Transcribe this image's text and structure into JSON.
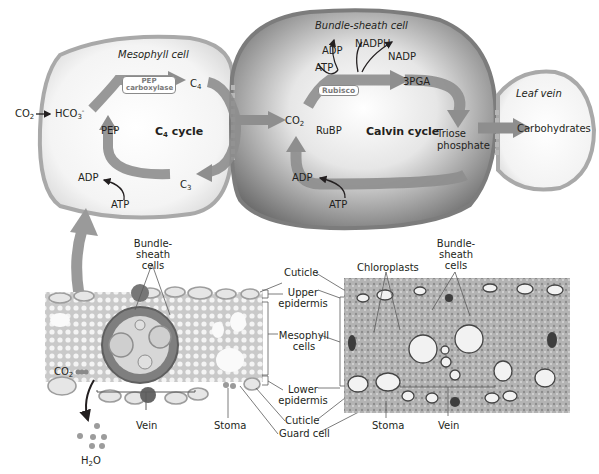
{
  "cells": {
    "mesophyll": {
      "title": "Mesophyll cell",
      "cycle": "C4 cycle",
      "enzyme": {
        "line1": "PEP",
        "line2": "carboxylase"
      },
      "labels": {
        "co2": "CO2",
        "hco3": "HCO3-",
        "pep": "PEP",
        "c4": "C4",
        "c3": "C3",
        "adp": "ADP",
        "atp": "ATP"
      }
    },
    "bundle_sheath": {
      "title": "Bundle-sheath cell",
      "cycle": "Calvin cycle",
      "enzyme": "Rubisco",
      "labels": {
        "co2": "CO2",
        "adp_top": "ADP",
        "atp_top": "ATP",
        "nadph": "NADPH",
        "nadp": "NADP",
        "pga": "3PGA",
        "rubp": "RuBP",
        "triose1": "Triose",
        "triose2": "phosphate",
        "adp_bottom": "ADP",
        "atp_bottom": "ATP"
      }
    },
    "leaf_vein": {
      "title": "Leaf vein",
      "product": "Carbohydrates"
    }
  },
  "cross_section": {
    "labels": {
      "bundle_sheath_1": "Bundle-",
      "bundle_sheath_2": "sheath",
      "bundle_sheath_3": "cells",
      "cuticle_top": "Cuticle",
      "upper_epidermis_1": "Upper",
      "upper_epidermis_2": "epidermis",
      "mesophyll_1": "Mesophyll",
      "mesophyll_2": "cells",
      "lower_epidermis_1": "Lower",
      "lower_epidermis_2": "epidermis",
      "cuticle_bottom": "Cuticle",
      "guard_cell": "Guard cell",
      "stoma": "Stoma",
      "vein": "Vein",
      "co2": "CO2",
      "h2o": "H2O"
    }
  },
  "micrograph": {
    "labels": {
      "chloroplasts": "Chloroplasts",
      "bundle_sheath_1": "Bundle-",
      "bundle_sheath_2": "sheath",
      "bundle_sheath_3": "cells",
      "stoma": "Stoma",
      "vein": "Vein"
    }
  },
  "colors": {
    "cell_wall": "#a9a9a9",
    "bundle_sheath_fill": "#8c8c8c",
    "mesophyll_fill": "#f2f2f2",
    "arrow": "#8e8e8e",
    "text": "#231f20"
  }
}
